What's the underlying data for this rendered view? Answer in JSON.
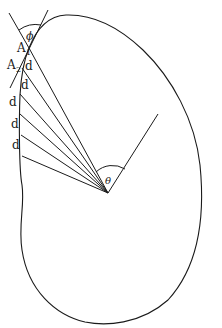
{
  "diagram": {
    "labels": {
      "phi": "ϕ",
      "theta": "θ",
      "a1": "A",
      "a1_sub": "1",
      "a2": "A",
      "a2_sub": "2",
      "segments": [
        "d",
        "d",
        "d",
        "d",
        "d"
      ]
    },
    "colors": {
      "stroke": "#1a1a1a",
      "background": "#ffffff"
    }
  }
}
